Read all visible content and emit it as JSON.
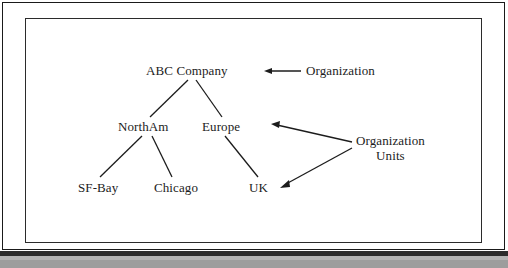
{
  "document": {
    "type": "scanned-diagram",
    "background_color": "#ffffff",
    "ink_color": "#1c1c1c"
  },
  "diagram": {
    "title": "",
    "nodes": [
      {
        "id": "root",
        "label": "ABC Company",
        "level": 0
      },
      {
        "id": "northam",
        "label": "NorthAm",
        "level": 1
      },
      {
        "id": "europe",
        "label": "Europe",
        "level": 1
      },
      {
        "id": "sfbay",
        "label": "SF-Bay",
        "level": 2
      },
      {
        "id": "chicago",
        "label": "Chicago",
        "level": 2
      },
      {
        "id": "uk",
        "label": "UK",
        "level": 2
      }
    ],
    "edges": [
      {
        "from": "root",
        "to": "northam"
      },
      {
        "from": "root",
        "to": "europe"
      },
      {
        "from": "northam",
        "to": "sfbay"
      },
      {
        "from": "northam",
        "to": "chicago"
      },
      {
        "from": "europe",
        "to": "uk"
      }
    ],
    "annotations": [
      {
        "id": "organization",
        "label": "Organization",
        "points_to": "root"
      },
      {
        "id": "organization-units",
        "label_line1": "Organization",
        "label_line2": "Units",
        "points_to": "europe, uk"
      }
    ]
  }
}
